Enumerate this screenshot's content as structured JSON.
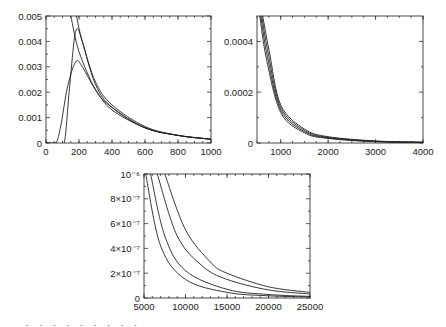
{
  "chart_data": [
    {
      "type": "line",
      "title": "",
      "xlabel": "",
      "ylabel": "",
      "xlim": [
        0,
        1000
      ],
      "ylim": [
        0,
        0.005
      ],
      "xticks": [
        "0",
        "200",
        "400",
        "600",
        "800",
        "1000"
      ],
      "yticks": [
        "0",
        "0.001",
        "0.002",
        "0.003",
        "0.004",
        "0.005"
      ],
      "grid": false,
      "legend": null,
      "series": [
        {
          "name": "curve1",
          "x": [
            130,
            150,
            200,
            300,
            400,
            600,
            800,
            1000
          ],
          "y": [
            0.0055,
            0.005,
            0.0036,
            0.0021,
            0.0014,
            0.0006,
            0.0003,
            0.00015
          ]
        },
        {
          "name": "curve2",
          "x": [
            175,
            185,
            220,
            300,
            400,
            600,
            800,
            1000
          ],
          "y": [
            0.0055,
            0.005,
            0.004,
            0.0024,
            0.0015,
            0.00065,
            0.0003,
            0.00015
          ]
        },
        {
          "name": "curve3",
          "x": [
            110,
            140,
            170,
            190,
            220,
            300,
            400,
            600,
            800,
            1000
          ],
          "y": [
            0,
            0.002,
            0.004,
            0.0045,
            0.004,
            0.0023,
            0.0014,
            0.0006,
            0.0003,
            0.00015
          ]
        },
        {
          "name": "curve4",
          "x": [
            60,
            90,
            130,
            180,
            220,
            300,
            400,
            600,
            800,
            1000
          ],
          "y": [
            0,
            0.0007,
            0.0022,
            0.0032,
            0.003,
            0.0021,
            0.0013,
            0.0006,
            0.0003,
            0.00015
          ]
        }
      ]
    },
    {
      "type": "line",
      "title": "",
      "xlim": [
        500,
        4000
      ],
      "ylim": [
        0,
        0.0005
      ],
      "xticks": [
        "1000",
        "2000",
        "3000",
        "4000"
      ],
      "yticks": [
        "0",
        "0.0002",
        "0.0004"
      ],
      "grid": false,
      "legend": null,
      "series": [
        {
          "name": "curve1",
          "x": [
            560,
            700,
            1000,
            1500,
            2000,
            3000,
            4000
          ],
          "y": [
            0.0005,
            0.00033,
            0.00012,
            4e-05,
            1.8e-05,
            5e-06,
            2e-06
          ]
        },
        {
          "name": "curve2",
          "x": [
            580,
            720,
            1000,
            1500,
            2000,
            3000,
            4000
          ],
          "y": [
            0.0005,
            0.00034,
            0.00013,
            4.5e-05,
            2e-05,
            6e-06,
            2e-06
          ]
        },
        {
          "name": "curve3",
          "x": [
            600,
            740,
            1000,
            1500,
            2000,
            3000,
            4000
          ],
          "y": [
            0.0005,
            0.00035,
            0.00014,
            5e-05,
            2.2e-05,
            7e-06,
            3e-06
          ]
        },
        {
          "name": "curve4",
          "x": [
            620,
            760,
            1000,
            1500,
            2000,
            3000,
            4000
          ],
          "y": [
            0.0005,
            0.00036,
            0.00015,
            5.5e-05,
            2.5e-05,
            8e-06,
            3e-06
          ]
        }
      ]
    },
    {
      "type": "line",
      "title": "",
      "xlim": [
        5000,
        25000
      ],
      "ylim": [
        0,
        1e-06
      ],
      "xticks": [
        "5000",
        "10000",
        "15000",
        "20000",
        "25000"
      ],
      "yticks": [
        "0",
        "2×10⁻⁷",
        "4×10⁻⁷",
        "6×10⁻⁷",
        "8×10⁻⁷",
        "10⁻⁶"
      ],
      "grid": false,
      "legend": null,
      "series": [
        {
          "name": "curve1",
          "x": [
            5200,
            7000,
            10000,
            15000,
            20000,
            25000
          ],
          "y": [
            1e-06,
            4.2e-07,
            1.5e-07,
            4.5e-08,
            1.8e-08,
            8e-09
          ]
        },
        {
          "name": "curve2",
          "x": [
            5800,
            7500,
            10000,
            15000,
            20000,
            25000
          ],
          "y": [
            1e-06,
            5e-07,
            2.2e-07,
            7e-08,
            2.8e-08,
            1.3e-08
          ]
        },
        {
          "name": "curve3",
          "x": [
            6600,
            9000,
            12000,
            15000,
            20000,
            25000
          ],
          "y": [
            1e-06,
            5e-07,
            2.6e-07,
            1.5e-07,
            6.5e-08,
            3.2e-08
          ]
        },
        {
          "name": "curve4",
          "x": [
            7500,
            10000,
            13000,
            15000,
            20000,
            25000
          ],
          "y": [
            1e-06,
            5.5e-07,
            2.9e-07,
            2e-07,
            9e-08,
            4.5e-08
          ]
        }
      ]
    }
  ],
  "caption_fragment": "· · · · · · · · ·"
}
